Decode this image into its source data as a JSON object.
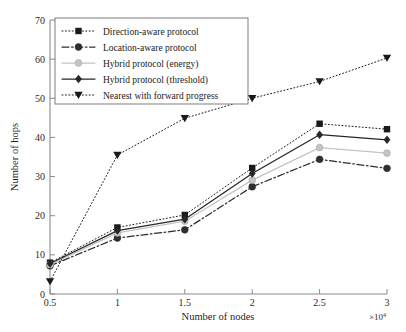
{
  "chart_data": {
    "type": "line",
    "title": "",
    "xlabel": "Number of nodes",
    "ylabel": "Number of hops",
    "x_multiplier": "×10",
    "x_multiplier_exponent": "4",
    "x": [
      0.5,
      1,
      1.5,
      2,
      2.5,
      3
    ],
    "xtick_labels": [
      "0.5",
      "1",
      "1.5",
      "2",
      "2.5",
      "3"
    ],
    "ytick_labels": [
      "0",
      "10",
      "20",
      "30",
      "40",
      "50",
      "60",
      "70"
    ],
    "yticks": [
      0,
      10,
      20,
      30,
      40,
      50,
      60,
      70
    ],
    "xlim": [
      0.5,
      3
    ],
    "ylim": [
      0,
      70
    ],
    "grid": false,
    "legend_position": "upper-left-inside",
    "series": [
      {
        "name": "Direction-aware protocol",
        "values": [
          8,
          17,
          20.2,
          32.2,
          43.5,
          42.1
        ],
        "marker": "square",
        "linestyle": "dotted",
        "color": "#1a1a1a"
      },
      {
        "name": "Location-aware protocol",
        "values": [
          7.2,
          14.3,
          16.4,
          27.4,
          34.4,
          32.1
        ],
        "marker": "circle",
        "linestyle": "dashdot",
        "color": "#2e2e2e"
      },
      {
        "name": "Hybrid protocol (energy)",
        "values": [
          7.5,
          15.6,
          18.6,
          29.1,
          37.4,
          36.0
        ],
        "marker": "circle",
        "linestyle": "solid",
        "color": "#c4c4c4"
      },
      {
        "name": "Hybrid protocol (threshold)",
        "values": [
          7.8,
          16.2,
          19.1,
          30.8,
          40.7,
          39.4
        ],
        "marker": "diamond",
        "linestyle": "solid",
        "color": "#262626"
      },
      {
        "name": "Nearest with forward progress",
        "values": [
          3.2,
          35.5,
          44.9,
          50.0,
          54.3,
          60.3
        ],
        "marker": "triangle-down",
        "linestyle": "dotted",
        "color": "#1a1a1a"
      }
    ]
  }
}
